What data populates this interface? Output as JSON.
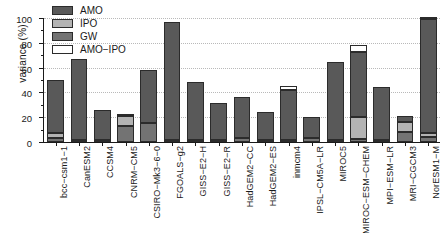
{
  "chart_data": {
    "type": "bar",
    "title": "",
    "xlabel": "",
    "ylabel": "variance (%)",
    "ylim": [
      0,
      100
    ],
    "yticks": [
      0,
      20,
      40,
      60,
      80,
      100
    ],
    "ytick_labels": [
      "0",
      "20",
      "40",
      "60",
      "80",
      "100"
    ],
    "grid": true,
    "stacked": true,
    "legend_position": "top-left",
    "bar_orientation": "vertical",
    "xtick_rotation": -90,
    "legend": [
      {
        "label": "AMO",
        "color": "#595959"
      },
      {
        "label": "IPO",
        "color": "#b3b3b3"
      },
      {
        "label": "GW",
        "color": "#737373"
      },
      {
        "label": "AMO−IPO",
        "color": "#ffffff"
      }
    ],
    "series": [
      {
        "name": "GW",
        "color": "#737373",
        "values": [
          3,
          1.5,
          1.5,
          13,
          15,
          1.5,
          1.5,
          1.5,
          3,
          1.5,
          2,
          3.5,
          1.5,
          2.5,
          1.5,
          8,
          4
        ]
      },
      {
        "name": "IPO",
        "color": "#b3b3b3",
        "values": [
          4,
          0,
          0,
          8,
          0,
          0,
          0,
          0,
          0,
          0,
          0,
          0,
          0,
          18,
          0,
          8,
          3
        ]
      },
      {
        "name": "AMO",
        "color": "#595959",
        "values": [
          43,
          65.5,
          24.5,
          1,
          43,
          95,
          47,
          30,
          33,
          23,
          40,
          16.5,
          63,
          52,
          43,
          5,
          92
        ]
      },
      {
        "name": "AMO−IPO",
        "color": "#ffffff",
        "values": [
          0,
          0,
          0,
          0,
          0,
          0,
          0,
          0,
          0,
          0,
          3.5,
          0,
          0,
          6,
          0,
          0,
          1.5
        ]
      }
    ],
    "categories": [
      "bcc−csm1−1",
      "CanESM2",
      "CCSM4",
      "CNRM−CM5",
      "CSIRO−Mk3−6−0",
      "FGOALS−g2",
      "GISS−E2−H",
      "GISS−E2−R",
      "HadGEM2−CC",
      "HadGEM2−ES",
      "inmcm4",
      "IPSL−CM5A−LR",
      "MIROC5",
      "MIROC−ESM−CHEM",
      "MPI−ESM−LR",
      "MRI−CGCM3",
      "NorESM1−M"
    ],
    "totals": [
      50,
      67,
      26,
      22,
      58,
      96.5,
      48.5,
      31.5,
      36,
      24.5,
      45.5,
      20,
      64.5,
      78.5,
      44.5,
      21,
      100.5
    ]
  },
  "style": {
    "axis_color": "#1a1a1a",
    "grid_color": "#b9b9b9",
    "background": "#ffffff"
  }
}
